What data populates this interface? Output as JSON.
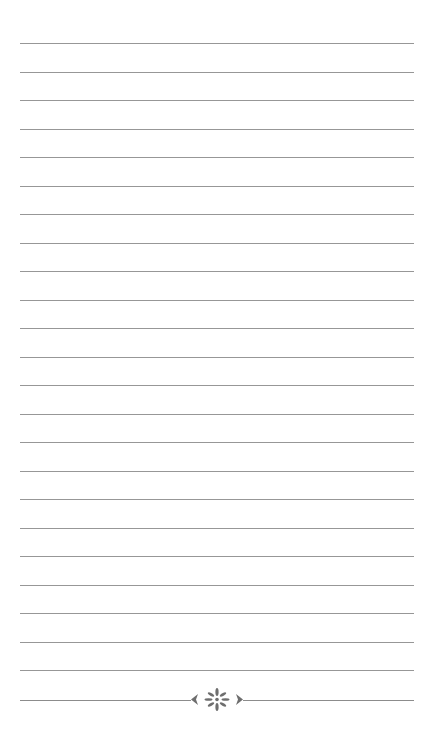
{
  "page": {
    "type": "lined-notepaper",
    "line_count": 23,
    "first_line_y": 43,
    "line_spacing": 28.5,
    "line_left": 20,
    "line_width": 394,
    "line_color": "#8c8c8c",
    "background_color": "#ffffff"
  },
  "footer": {
    "ornament_y": 700,
    "ornament_icon": "floral-divider-icon",
    "ornament_color": "#6e6e6e"
  }
}
